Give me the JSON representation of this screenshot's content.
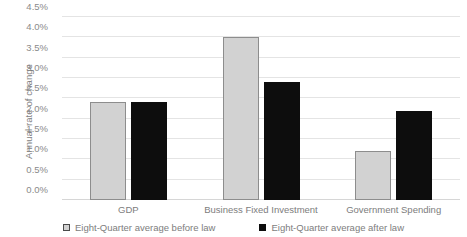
{
  "chart_data": {
    "type": "bar",
    "title": "",
    "subtitle": "",
    "xlabel": "",
    "ylabel": "Annual rate of change",
    "categories": [
      "GDP",
      "Business Fixed Investment",
      "Government Spending"
    ],
    "series": [
      {
        "name": "Eight-Quarter average before law",
        "values": [
          2.4,
          4.0,
          1.2
        ],
        "color": "#d2d2d2",
        "border_color": "#8d8d8d"
      },
      {
        "name": "Eight-Quarter average after law",
        "values": [
          2.4,
          2.9,
          2.2
        ],
        "color": "#0d0d0d",
        "border_color": "#0d0d0d"
      }
    ],
    "ylim": [
      0.0,
      4.5
    ],
    "ytick_values": [
      0.0,
      0.5,
      1.0,
      1.5,
      2.0,
      2.5,
      3.0,
      3.5,
      4.0,
      4.5
    ],
    "ytick_labels": [
      "0.0%",
      "0.5%",
      "1.0%",
      "1.5%",
      "2.0%",
      "2.5%",
      "3.0%",
      "3.5%",
      "4.0%",
      "4.5%"
    ],
    "grid": true,
    "grid_color": "#e4e4e4",
    "legend_position": "bottom-center",
    "value_unit": "%"
  },
  "axis": {
    "y_title": "Annual rate of change"
  },
  "legend": {
    "items": [
      {
        "label": "Eight-Quarter average before law",
        "swatch": "before"
      },
      {
        "label": "Eight-Quarter average after law",
        "swatch": "after"
      }
    ]
  }
}
